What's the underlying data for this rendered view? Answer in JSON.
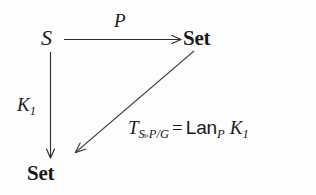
{
  "diagram": {
    "type": "category-theory-commutative-square",
    "background_color": "#fdfdfd",
    "ink_color": "#1a1a1a",
    "nodes": [
      {
        "id": "source",
        "text": "S",
        "style": "italic",
        "x": 48,
        "y": 40,
        "role": "domain-category"
      },
      {
        "id": "target-top",
        "text": "Set",
        "style": "bold",
        "x": 198,
        "y": 40,
        "role": "codomain-category"
      },
      {
        "id": "target-bot",
        "text": "Set",
        "style": "bold",
        "x": 50,
        "y": 175,
        "role": "codomain-category"
      }
    ],
    "arrows": [
      {
        "id": "top-arrow",
        "label": "P",
        "from": "source",
        "to": "target-top",
        "direction": "right"
      },
      {
        "id": "left-arrow",
        "label": "K1",
        "from": "source",
        "to": "target-bot",
        "direction": "down"
      },
      {
        "id": "diagonal-arrow",
        "label": "T",
        "from": "target-top",
        "to": "target-bot",
        "direction": "down-left"
      }
    ],
    "labels": {
      "top_arrow_label": "P",
      "left_arrow_label_base": "K",
      "left_arrow_label_sub": "1"
    },
    "formula": {
      "lhs_base": "T",
      "lhs_sub_1": "S",
      "lhs_sub_triangle": "▹",
      "lhs_sub_2": "P",
      "lhs_sub_slash": "/",
      "lhs_sub_3": "G",
      "equals": "=",
      "rhs_operator": "Lan",
      "rhs_operator_sub": "P",
      "rhs_arg_base": "K",
      "rhs_arg_sub": "1",
      "plain_text": "T_{S▹P/G} = Lan_P K_1"
    }
  }
}
